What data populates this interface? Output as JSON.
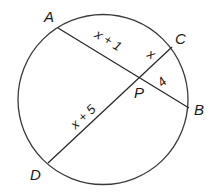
{
  "diagram": {
    "type": "circle-intersecting-chords",
    "circle": {
      "cx": 103,
      "cy": 99.5,
      "r": 85,
      "stroke": "#3a3a3a"
    },
    "points": {
      "A": {
        "label": "A",
        "x": 58,
        "y": 28
      },
      "B": {
        "label": "B",
        "x": 189,
        "y": 108
      },
      "C": {
        "label": "C",
        "x": 172,
        "y": 47
      },
      "D": {
        "label": "D",
        "x": 48,
        "y": 163
      },
      "P": {
        "label": "P",
        "x": 140,
        "y": 78
      }
    },
    "chords": [
      {
        "name": "AB",
        "from": "A",
        "to": "B"
      },
      {
        "name": "DC",
        "from": "D",
        "to": "C"
      }
    ],
    "segment_labels": {
      "AP": "x + 1",
      "PC": "x",
      "PB": "4",
      "DP": "x + 5"
    }
  }
}
